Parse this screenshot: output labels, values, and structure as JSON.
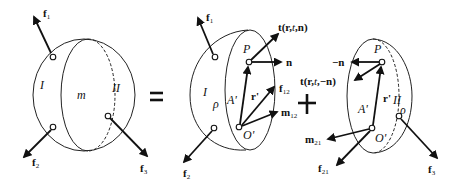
{
  "figure": {
    "whole_body": {
      "region_labels": {
        "left": "I",
        "center": "m",
        "right": "II"
      },
      "forces": [
        {
          "name": "f",
          "sub": "1"
        },
        {
          "name": "f",
          "sub": "2"
        },
        {
          "name": "f",
          "sub": "3"
        }
      ]
    },
    "equals_symbol": "=",
    "plus_symbol": "+",
    "part_I": {
      "region_label": "I",
      "density_label": "ρ",
      "surface_label": "A'",
      "point_P": "P",
      "point_O": "O'",
      "position_vector": "r'",
      "traction": {
        "text": "t(",
        "r": "r",
        "sep1": ",",
        "t": "t",
        "sep2": ",",
        "n": "n",
        "close": ")"
      },
      "normal": "n",
      "resultant_force": {
        "name": "f",
        "sub": "12"
      },
      "resultant_moment": {
        "name": "m",
        "sub": "12"
      },
      "forces": [
        {
          "name": "f",
          "sub": "1"
        },
        {
          "name": "f",
          "sub": "2"
        }
      ]
    },
    "part_II": {
      "region_label": "II",
      "density_label": "ρ",
      "surface_label": "A'",
      "point_P": "P",
      "point_O": "O'",
      "position_vector": "r'",
      "traction": {
        "text": "t(",
        "r": "r",
        "sep1": ",",
        "t": "t",
        "sep2": ",",
        "n": "−n",
        "close": ")"
      },
      "normal": "−n",
      "resultant_force": {
        "name": "f",
        "sub": "21"
      },
      "resultant_moment": {
        "name": "m",
        "sub": "21"
      },
      "forces": [
        {
          "name": "f",
          "sub": "3"
        }
      ]
    }
  }
}
